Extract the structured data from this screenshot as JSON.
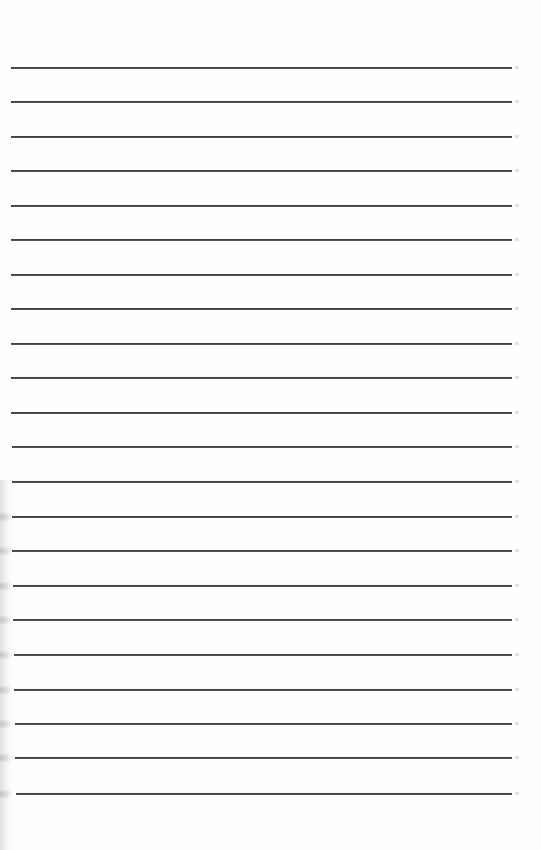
{
  "document": {
    "type": "lined-paper",
    "text": "",
    "line_count": 22,
    "line_color": "#444444",
    "background_color": "#fefefe",
    "lines": [
      {
        "y": 68,
        "x1": 11,
        "x2": 512
      },
      {
        "y": 102,
        "x1": 11,
        "x2": 512
      },
      {
        "y": 137,
        "x1": 11,
        "x2": 512
      },
      {
        "y": 171,
        "x1": 11,
        "x2": 512
      },
      {
        "y": 206,
        "x1": 11,
        "x2": 512
      },
      {
        "y": 240,
        "x1": 11,
        "x2": 512
      },
      {
        "y": 275,
        "x1": 11,
        "x2": 512
      },
      {
        "y": 309,
        "x1": 11,
        "x2": 512
      },
      {
        "y": 344,
        "x1": 11,
        "x2": 512
      },
      {
        "y": 378,
        "x1": 11,
        "x2": 512
      },
      {
        "y": 413,
        "x1": 11,
        "x2": 512
      },
      {
        "y": 447,
        "x1": 12,
        "x2": 512
      },
      {
        "y": 482,
        "x1": 12,
        "x2": 512
      },
      {
        "y": 517,
        "x1": 12,
        "x2": 512
      },
      {
        "y": 551,
        "x1": 12,
        "x2": 512
      },
      {
        "y": 586,
        "x1": 13,
        "x2": 512
      },
      {
        "y": 620,
        "x1": 13,
        "x2": 512
      },
      {
        "y": 655,
        "x1": 14,
        "x2": 512
      },
      {
        "y": 690,
        "x1": 14,
        "x2": 512
      },
      {
        "y": 724,
        "x1": 15,
        "x2": 512
      },
      {
        "y": 758,
        "x1": 15,
        "x2": 512
      },
      {
        "y": 794,
        "x1": 16,
        "x2": 512
      }
    ]
  }
}
